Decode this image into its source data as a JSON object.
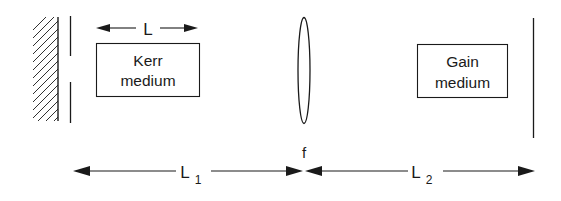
{
  "diagram": {
    "type": "laser-cavity-schematic",
    "components": {
      "end_mirror_left": {
        "kind": "flat-mirror-hatched"
      },
      "aperture": {
        "kind": "slit"
      },
      "kerr_medium": {
        "line1": "Kerr",
        "line2": "medium",
        "length_label": "L"
      },
      "lens": {
        "label": "f"
      },
      "gain_medium": {
        "line1": "Gain",
        "line2": "medium"
      },
      "end_mirror_right": {
        "kind": "flat-mirror"
      }
    },
    "distances": {
      "left": {
        "label": "L",
        "subscript": "1"
      },
      "right": {
        "label": "L",
        "subscript": "2"
      }
    },
    "colors": {
      "ink": "#1a1a1a",
      "background": "#ffffff"
    }
  }
}
